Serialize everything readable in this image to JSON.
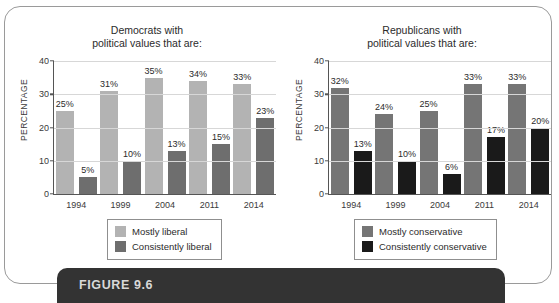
{
  "figure": {
    "caption_label": "FIGURE 9.6"
  },
  "charts": [
    {
      "id": "democrats",
      "title": "Democrats with\npolitical values that are:",
      "ylabel": "PERCENTAGE",
      "legend": [
        {
          "label": "Mostly liberal",
          "color": "#b3b3b3"
        },
        {
          "label": "Consistently liberal",
          "color": "#6e6e6e"
        }
      ]
    },
    {
      "id": "republicans",
      "title": "Republicans with\npolitical values that are:",
      "ylabel": "PERCENTAGE",
      "legend": [
        {
          "label": "Mostly conservative",
          "color": "#757575"
        },
        {
          "label": "Consistently conservative",
          "color": "#1a1a1a"
        }
      ]
    }
  ],
  "chart_data": [
    {
      "type": "bar",
      "title": "Democrats with political values that are:",
      "xlabel": "",
      "ylabel": "PERCENTAGE",
      "ylim": [
        0,
        40
      ],
      "yticks": [
        0,
        10,
        20,
        30,
        40
      ],
      "ytick_labels": [
        "0",
        "10",
        "20",
        "30",
        "40"
      ],
      "grid": true,
      "legend_position": "bottom",
      "categories": [
        "1994",
        "1999",
        "2004",
        "2011",
        "2014"
      ],
      "series": [
        {
          "name": "Mostly liberal",
          "color": "#b3b3b3",
          "values": [
            25,
            31,
            35,
            34,
            33
          ],
          "data_labels": [
            "25%",
            "31%",
            "35%",
            "34%",
            "33%"
          ]
        },
        {
          "name": "Consistently liberal",
          "color": "#6e6e6e",
          "values": [
            5,
            10,
            13,
            15,
            23
          ],
          "data_labels": [
            "5%",
            "10%",
            "13%",
            "15%",
            "23%"
          ]
        }
      ]
    },
    {
      "type": "bar",
      "title": "Republicans with political values that are:",
      "xlabel": "",
      "ylabel": "PERCENTAGE",
      "ylim": [
        0,
        40
      ],
      "yticks": [
        0,
        10,
        20,
        30,
        40
      ],
      "ytick_labels": [
        "0",
        "10",
        "20",
        "30",
        "40"
      ],
      "grid": true,
      "legend_position": "bottom",
      "categories": [
        "1994",
        "1999",
        "2004",
        "2011",
        "2014"
      ],
      "series": [
        {
          "name": "Mostly conservative",
          "color": "#757575",
          "values": [
            32,
            24,
            25,
            33,
            33
          ],
          "data_labels": [
            "32%",
            "24%",
            "25%",
            "33%",
            "33%"
          ]
        },
        {
          "name": "Consistently conservative",
          "color": "#1a1a1a",
          "values": [
            13,
            10,
            6,
            17,
            20
          ],
          "data_labels": [
            "13%",
            "10%",
            "6%",
            "17%",
            "20%"
          ]
        }
      ]
    }
  ]
}
